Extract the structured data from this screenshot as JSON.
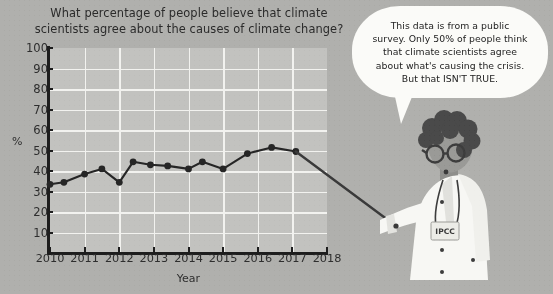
{
  "chart_data": {
    "type": "line",
    "title": "What percentage of people believe that climate scientists agree about the causes of climate change?",
    "title_line1": "What percentage of people believe that climate",
    "title_line2": "scientists agree about the causes of climate change?",
    "xlabel": "Year",
    "ylabel": "%",
    "xlim": [
      2010,
      2018
    ],
    "ylim": [
      0,
      100
    ],
    "ytick_labels": [
      "100",
      "90",
      "80",
      "70",
      "60",
      "50",
      "40",
      "30",
      "20",
      "10"
    ],
    "yticks": [
      100,
      90,
      80,
      70,
      60,
      50,
      40,
      30,
      20,
      10
    ],
    "xtick_labels": [
      "2010",
      "2011",
      "2012",
      "2013",
      "2014",
      "2015",
      "2016",
      "2017",
      "2018"
    ],
    "xticks": [
      2010,
      2011,
      2012,
      2013,
      2014,
      2015,
      2016,
      2017,
      2018
    ],
    "grid": true,
    "legend": "none",
    "marker": "filled-circle",
    "line_color": "#262626",
    "plot_background": "#c2c2bf",
    "gridline_color": "#f2f2ef",
    "x": [
      2010.0,
      2010.4,
      2011.0,
      2011.5,
      2012.0,
      2012.4,
      2012.9,
      2013.4,
      2014.0,
      2014.4,
      2015.0,
      2015.4,
      2016.2,
      2017.0,
      2017.6
    ],
    "values": [
      33.5,
      34.5,
      38.5,
      41,
      34.5,
      44.5,
      43,
      42.5,
      41,
      44.5,
      41,
      48.5,
      51.5,
      51.5,
      49.5
    ],
    "points": [
      {
        "x": 2010.0,
        "y": 33.5
      },
      {
        "x": 2010.4,
        "y": 34.5
      },
      {
        "x": 2011.0,
        "y": 38.5
      },
      {
        "x": 2011.5,
        "y": 41.0
      },
      {
        "x": 2012.0,
        "y": 34.5
      },
      {
        "x": 2012.4,
        "y": 44.5
      },
      {
        "x": 2012.9,
        "y": 43.0
      },
      {
        "x": 2013.4,
        "y": 42.5
      },
      {
        "x": 2014.0,
        "y": 41.0
      },
      {
        "x": 2014.4,
        "y": 44.5
      },
      {
        "x": 2015.0,
        "y": 41.0
      },
      {
        "x": 2015.7,
        "y": 48.5
      },
      {
        "x": 2016.4,
        "y": 51.5
      },
      {
        "x": 2017.1,
        "y": 49.5
      }
    ],
    "annotation": "A pointer stick held by the scientist extends from the last data point down to the right."
  },
  "speech_bubble": {
    "lines": [
      "This data is from a public",
      "survey. Only 50% of people think",
      "that climate scientists agree",
      "about what's causing the crisis.",
      "But that ISN'T TRUE."
    ],
    "full_text": "This data is from a public survey. Only 50% of people think that climate scientists agree about what's causing the crisis. But that ISN'T TRUE."
  },
  "character": {
    "name": "climate-scientist",
    "badge_text": "IPCC",
    "coat_color": "#f7f7f4",
    "hair_color": "#4a4a4a",
    "skin_color": "#9a9a97"
  },
  "palette": {
    "page_background": "#b0b0ad",
    "plot_background": "#c2c2bf",
    "ink": "#1d1d1d",
    "paper_white": "#fbfbf8"
  }
}
